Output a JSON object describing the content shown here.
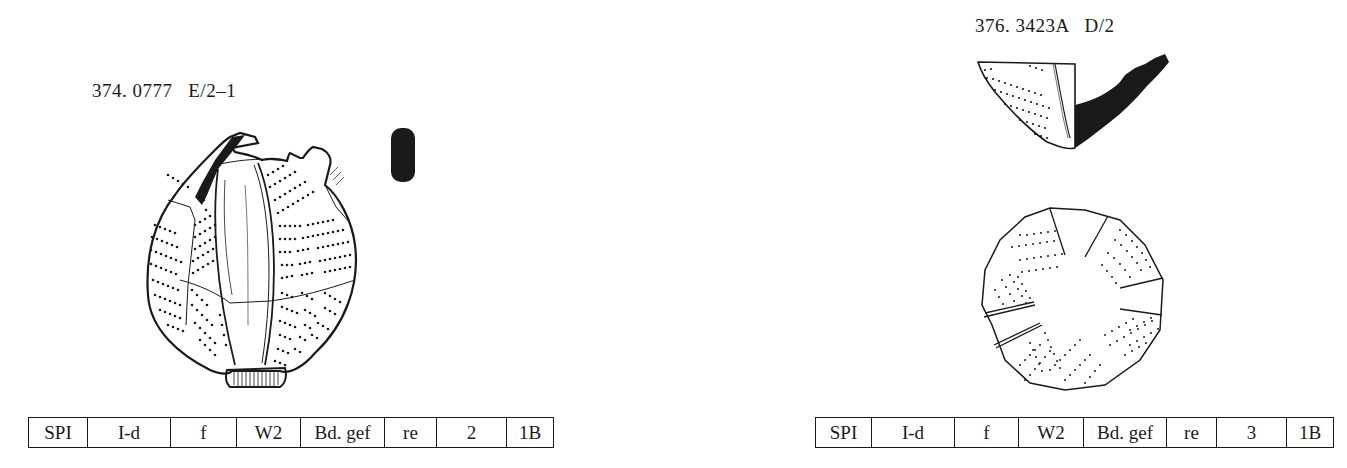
{
  "entries": [
    {
      "catalog_label": "374. 0777   E/2–1",
      "number": "374",
      "inventory": "0777",
      "context": "E/2–1",
      "attributes": [
        "SPI",
        "I-d",
        "f",
        "W2",
        "Bd. gef",
        "re",
        "2",
        "1B"
      ],
      "drawings": [
        "vessel-side-view",
        "wall-section-profile"
      ]
    },
    {
      "catalog_label": "376. 3423A   D/2",
      "number": "376",
      "inventory": "3423A",
      "context": "D/2",
      "attributes": [
        "SPI",
        "I-d",
        "f",
        "W2",
        "Bd. gef",
        "re",
        "3",
        "1B"
      ],
      "drawings": [
        "base-fragment-profile",
        "base-top-view"
      ]
    }
  ],
  "colors": {
    "ink": "#1a1a1a",
    "paper": "#ffffff"
  }
}
